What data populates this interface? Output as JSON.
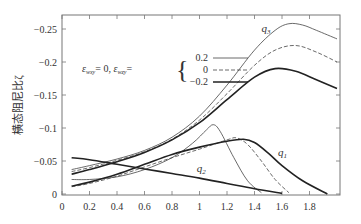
{
  "chart_data": {
    "type": "line",
    "title": "",
    "xlabel": "",
    "ylabel": "横态阻尼比ζ",
    "xlim": [
      0,
      2.0
    ],
    "ylim": [
      0,
      -0.272
    ],
    "xticks": [
      "0",
      "0.2",
      "0.4",
      "0.6",
      "0.8",
      "1",
      "1.2",
      "1.4",
      "1.6",
      "1.8"
    ],
    "yticks": [
      "0",
      "−0.05",
      "−0.1",
      "−0.15",
      "−0.2",
      "−0.25"
    ],
    "ytick_values": [
      0,
      -0.05,
      -0.1,
      -0.15,
      -0.2,
      -0.25
    ],
    "grid": false,
    "legend": {
      "prefix": "ε",
      "prefix_sub": "wxy",
      "prefix_val": "= 0, ",
      "var": "ε",
      "var_sub": "wzy",
      "var_eq": "=",
      "entries": [
        {
          "label": "0.2",
          "style": "thin"
        },
        {
          "label": "0",
          "style": "dashed"
        },
        {
          "label": "−0.2",
          "style": "thick"
        }
      ]
    },
    "annotations": [
      {
        "text": "q",
        "sub": "3",
        "x": 1.45,
        "y": -0.245
      },
      {
        "text": "q",
        "sub": "1",
        "x": 1.57,
        "y": -0.058
      },
      {
        "text": "q",
        "sub": "2",
        "x": 0.98,
        "y": -0.033
      }
    ],
    "series": [
      {
        "name": "q3 ε_wzy=0.2",
        "style": "thin",
        "x": [
          0.07,
          0.2,
          0.4,
          0.6,
          0.8,
          1.0,
          1.2,
          1.4,
          1.55,
          1.65,
          1.75,
          1.85,
          2.0
        ],
        "y": [
          -0.037,
          -0.043,
          -0.053,
          -0.066,
          -0.086,
          -0.118,
          -0.165,
          -0.218,
          -0.248,
          -0.258,
          -0.256,
          -0.248,
          -0.235
        ]
      },
      {
        "name": "q3 ε_wzy=0",
        "style": "dashed",
        "x": [
          0.07,
          0.2,
          0.4,
          0.6,
          0.8,
          1.0,
          1.2,
          1.4,
          1.55,
          1.7,
          1.85,
          2.0
        ],
        "y": [
          -0.034,
          -0.04,
          -0.051,
          -0.064,
          -0.083,
          -0.112,
          -0.152,
          -0.195,
          -0.218,
          -0.225,
          -0.215,
          -0.2
        ]
      },
      {
        "name": "q3 ε_wzy=−0.2",
        "style": "thick",
        "x": [
          0.07,
          0.2,
          0.4,
          0.6,
          0.8,
          1.0,
          1.2,
          1.4,
          1.55,
          1.7,
          1.85,
          2.0
        ],
        "y": [
          -0.03,
          -0.037,
          -0.049,
          -0.063,
          -0.082,
          -0.108,
          -0.143,
          -0.177,
          -0.19,
          -0.186,
          -0.173,
          -0.16
        ]
      },
      {
        "name": "q1 ε_wzy=0.2",
        "style": "thin",
        "x": [
          0.07,
          0.2,
          0.4,
          0.6,
          0.8,
          0.95,
          1.05,
          1.1,
          1.15,
          1.25,
          1.35,
          1.45
        ],
        "y": [
          -0.022,
          -0.022,
          -0.026,
          -0.037,
          -0.055,
          -0.077,
          -0.097,
          -0.105,
          -0.095,
          -0.055,
          -0.02,
          -0.002
        ]
      },
      {
        "name": "q1 ε_wzy=0",
        "style": "dashed",
        "x": [
          0.07,
          0.2,
          0.4,
          0.6,
          0.8,
          1.0,
          1.2,
          1.27,
          1.35,
          1.45,
          1.55,
          1.65
        ],
        "y": [
          -0.011,
          -0.016,
          -0.027,
          -0.041,
          -0.055,
          -0.068,
          -0.082,
          -0.085,
          -0.075,
          -0.05,
          -0.022,
          -0.002
        ]
      },
      {
        "name": "q1 ε_wzy=−0.2",
        "style": "thick",
        "x": [
          0.07,
          0.2,
          0.4,
          0.6,
          0.8,
          1.0,
          1.2,
          1.32,
          1.4,
          1.5,
          1.6,
          1.75,
          1.93
        ],
        "y": [
          -0.012,
          -0.018,
          -0.03,
          -0.045,
          -0.06,
          -0.071,
          -0.08,
          -0.083,
          -0.078,
          -0.062,
          -0.043,
          -0.02,
          0.0
        ]
      },
      {
        "name": "q2",
        "style": "thick",
        "x": [
          0.07,
          0.2,
          0.4,
          0.6,
          0.8,
          1.0,
          1.2,
          1.4,
          1.6
        ],
        "y": [
          -0.055,
          -0.052,
          -0.045,
          -0.038,
          -0.031,
          -0.024,
          -0.016,
          -0.008,
          -0.001
        ]
      }
    ]
  }
}
